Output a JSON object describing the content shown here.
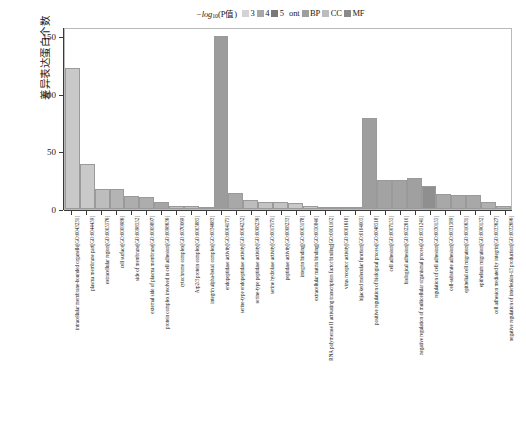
{
  "legend": {
    "title_prefix": "−log",
    "title_sub": "10",
    "title_paren": "(P值)",
    "pvalue_items": [
      {
        "label": "3",
        "color": "#d3d3d3"
      },
      {
        "label": "4",
        "color": "#a8a8a8"
      },
      {
        "label": "5",
        "color": "#787878"
      }
    ],
    "ont_label": "ont",
    "ont_items": [
      {
        "label": "BP",
        "color": "#9e9e9e"
      },
      {
        "label": "CC",
        "color": "#bcbcbc"
      },
      {
        "label": "MF",
        "color": "#8a8a8a"
      }
    ]
  },
  "axes": {
    "y_title": "差异表达蛋白个数",
    "y_ticks": [
      "150",
      "100",
      "50",
      "0"
    ],
    "y_min": 0,
    "y_max": 158
  },
  "chart_data": {
    "type": "bar",
    "title": "",
    "xlabel": "",
    "ylabel": "差异表达蛋白个数",
    "ylim": [
      0,
      158
    ],
    "ytick_values": [
      0,
      50,
      100,
      150
    ],
    "grid": false,
    "legend_position": "top",
    "legend_entries": [
      "3",
      "4",
      "5",
      "BP",
      "CC",
      "MF"
    ],
    "categories": [
      "intracellular membrane-bounded organelle[GO:0043231]",
      "plasma membrane part[GO:0044459]",
      "extracellular region[GO:0005576]",
      "cell surface[GO:0009986]",
      "side of membrane[GO:0098552]",
      "external side of plasma membrane[GO:0009897]",
      "protein complex involved in cell adhesion[GO:0098636]",
      "cytochrome complex[GO:0070069]",
      "Arp2/3 protein complex[GO:0005885]",
      "integrin alpha-beta1 complex[GO:0034683]",
      "endopeptidase activity[GO:0004175]",
      "serine-type endopeptidase activity[GO:0004252]",
      "serine-type peptidase activity[GO:0008236]",
      "serine hydrolase activity[GO:0017171]",
      "peptidase activity[GO:0008233]",
      "integrin binding[GO:0005178]",
      "extracellular matrix binding[GO:0050840]",
      "RNA polymerase II activating transcription factor binding[GO:0001102]",
      "virus receptor activity[GO:0001618]",
      "hijacked molecular function[GO:0104005]",
      "positive regulation of biological process[GO:0048518]",
      "cell adhesion[GO:0007155]",
      "biological adhesion[GO:0022610]",
      "negative regulation of multicellular organismal process[GO:0051241]",
      "regulation of cell adhesion[GO:0030155]",
      "cell-substrate adhesion[GO:0031589]",
      "epithelial cell migration[GO:0010631]",
      "epithelium migration[GO:0090132]",
      "cell adhesion mediated by integrin[GO:0033627]",
      "negative regulation of interleukin-13 production[GO:0032696]"
    ],
    "values": [
      122,
      39,
      17,
      17,
      11,
      10,
      6,
      3,
      3,
      2,
      150,
      14,
      8,
      6,
      6,
      5,
      3,
      2,
      2,
      1,
      79,
      25,
      25,
      27,
      20,
      13,
      12,
      12,
      6,
      3
    ],
    "ontology": [
      "CC",
      "CC",
      "CC",
      "CC",
      "CC",
      "CC",
      "CC",
      "CC",
      "CC",
      "CC",
      "MF",
      "MF",
      "MF",
      "MF",
      "MF",
      "MF",
      "MF",
      "MF",
      "MF",
      "MF",
      "BP",
      "BP",
      "BP",
      "BP",
      "BP",
      "BP",
      "BP",
      "BP",
      "BP",
      "BP"
    ],
    "bar_colors": [
      "#c9c9c9",
      "#c9c9c9",
      "#bdbdbd",
      "#b4b4b4",
      "#adadad",
      "#adadad",
      "#a5a5a5",
      "#c0c0c0",
      "#c0c0c0",
      "#c0c0c0",
      "#9c9c9c",
      "#a8a8a8",
      "#bdbdbd",
      "#c4c4c4",
      "#c4c4c4",
      "#c9c9c9",
      "#c9c9c9",
      "#cccccc",
      "#cccccc",
      "#cccccc",
      "#9e9e9e",
      "#a3a3a3",
      "#a3a3a3",
      "#a0a0a0",
      "#8f8f8f",
      "#a8a8a8",
      "#a8a8a8",
      "#a8a8a8",
      "#b0b0b0",
      "#b5b5b5"
    ]
  }
}
